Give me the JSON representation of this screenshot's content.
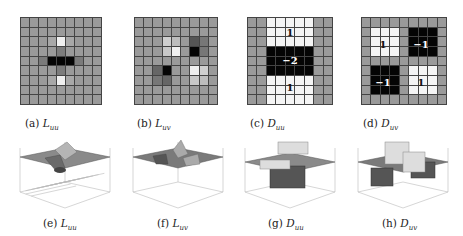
{
  "figure": {
    "panels": [
      {
        "id": "a",
        "caption_prefix": "(a)",
        "symbol": "L",
        "subscript": "uu",
        "kind": "gaussian-2nd-derivative-grid",
        "grid_size": 9
      },
      {
        "id": "b",
        "caption_prefix": "(b)",
        "symbol": "L",
        "subscript": "uv",
        "kind": "gaussian-2nd-derivative-grid",
        "grid_size": 9
      },
      {
        "id": "c",
        "caption_prefix": "(c)",
        "symbol": "D",
        "subscript": "uu",
        "kind": "box-filter-grid",
        "grid_size": 9,
        "labels": [
          "1",
          "−2",
          "1"
        ]
      },
      {
        "id": "d",
        "caption_prefix": "(d)",
        "symbol": "D",
        "subscript": "uv",
        "kind": "box-filter-grid",
        "grid_size": 9,
        "labels": [
          "1",
          "−1",
          "−1",
          "1"
        ]
      },
      {
        "id": "e",
        "caption_prefix": "(e)",
        "symbol": "L",
        "subscript": "uu",
        "kind": "3d-surface"
      },
      {
        "id": "f",
        "caption_prefix": "(f)",
        "symbol": "L",
        "subscript": "uv",
        "kind": "3d-surface"
      },
      {
        "id": "g",
        "caption_prefix": "(g)",
        "symbol": "D",
        "subscript": "uu",
        "kind": "3d-box-plot"
      },
      {
        "id": "h",
        "caption_prefix": "(h)",
        "symbol": "D",
        "subscript": "uv",
        "kind": "3d-box-plot"
      }
    ],
    "colors": {
      "neutral": "#9a9a9a",
      "positive": "#f4f4f4",
      "negative": "#050505",
      "gridline": "#444444"
    }
  }
}
